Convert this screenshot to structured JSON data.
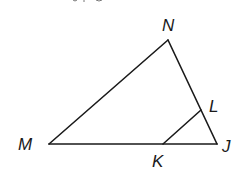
{
  "figure": {
    "type": "triangle",
    "vertices": {
      "M": {
        "x": 49,
        "y": 144
      },
      "N": {
        "x": 168,
        "y": 40
      },
      "J": {
        "x": 217,
        "y": 144
      },
      "K": {
        "x": 163,
        "y": 144
      },
      "L": {
        "x": 201,
        "y": 110
      }
    },
    "segments": [
      {
        "from": "M",
        "to": "N"
      },
      {
        "from": "N",
        "to": "J"
      },
      {
        "from": "M",
        "to": "J"
      },
      {
        "from": "K",
        "to": "L"
      }
    ],
    "labels": {
      "N": "N",
      "L": "L",
      "M": "M",
      "J": "J",
      "K": "K"
    }
  }
}
